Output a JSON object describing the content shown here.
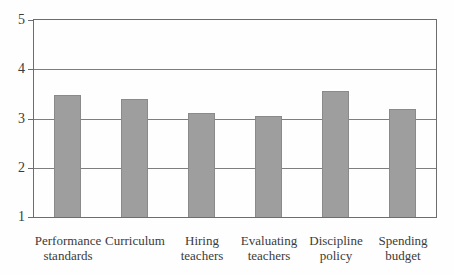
{
  "figure": {
    "background": "#fefefe",
    "text_color": "#3b3b3b",
    "frame_color": "#6d6d6d",
    "gridline_color": "#7e7e7e",
    "bar_fill_color": "#9e9e9e",
    "bar_border_color": "#8a8a8a"
  },
  "chart_data": {
    "type": "bar",
    "title": "",
    "xlabel": "",
    "ylabel": "",
    "categories": [
      "Performance standards",
      "Curriculum",
      "Hiring teachers",
      "Evaluating teachers",
      "Discipline policy",
      "Spending budget"
    ],
    "category_label_lines": [
      [
        "Performance",
        "standards"
      ],
      [
        "Curriculum"
      ],
      [
        "Hiring",
        "teachers"
      ],
      [
        "Evaluating",
        "teachers"
      ],
      [
        "Discipline",
        "policy"
      ],
      [
        "Spending",
        "budget"
      ]
    ],
    "values": [
      3.48,
      3.4,
      3.12,
      3.06,
      3.55,
      3.19
    ],
    "ylim": [
      1,
      5
    ],
    "yticks": [
      1,
      2,
      3,
      4,
      5
    ],
    "grid": true,
    "legend_position": "none",
    "single_series": true
  }
}
